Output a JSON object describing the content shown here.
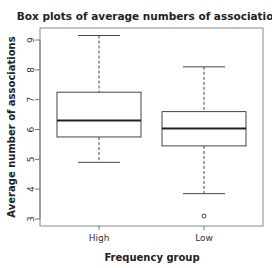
{
  "chart_data": {
    "type": "box",
    "title": "Box plots of average numbers of associations",
    "xlabel": "Frequency group",
    "ylabel": "Average number of associations",
    "categories": [
      "High",
      "Low"
    ],
    "yticks": [
      3,
      4,
      5,
      6,
      7,
      8,
      9
    ],
    "ylim": [
      2.75,
      9.4
    ],
    "series": [
      {
        "name": "High",
        "whisker_low": 4.9,
        "q1": 5.75,
        "median": 6.3,
        "q3": 7.25,
        "whisker_high": 9.15,
        "outliers": []
      },
      {
        "name": "Low",
        "whisker_low": 3.85,
        "q1": 5.45,
        "median": 6.03,
        "q3": 6.6,
        "whisker_high": 8.1,
        "outliers": [
          3.1
        ]
      }
    ],
    "grid": false,
    "legend": "none"
  },
  "colors": {
    "box_stroke": "#444444",
    "median": "#222222",
    "axis": "#777777"
  }
}
